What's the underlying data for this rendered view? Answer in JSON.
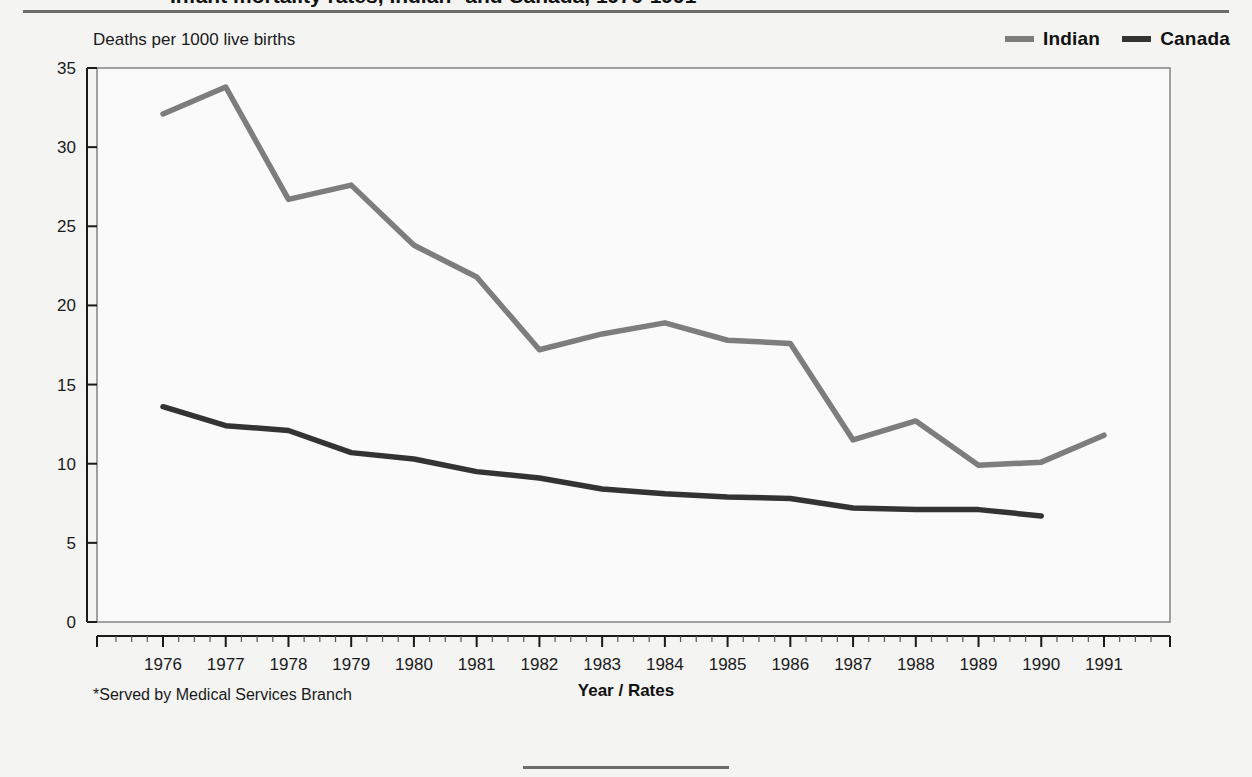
{
  "page": {
    "title_fragment": "Infant mortality rates, Indian* and Canada, 1976-1991",
    "background_color": "#f4f4f3",
    "rule_color": "#6d6d6d"
  },
  "legend": {
    "items": [
      {
        "label": "Indian",
        "color": "#7d7d7d"
      },
      {
        "label": "Canada",
        "color": "#333333"
      }
    ]
  },
  "labels": {
    "y_axis_caption": "Deaths per 1000 live births",
    "x_axis_title": "Year / Rates",
    "footnote": "*Served by Medical Services Branch"
  },
  "chart_data": {
    "type": "line",
    "title": "",
    "xlabel": "Year / Rates",
    "ylabel": "Deaths per 1000 live births",
    "x": [
      1976,
      1977,
      1978,
      1979,
      1980,
      1981,
      1982,
      1983,
      1984,
      1985,
      1986,
      1987,
      1988,
      1989,
      1990,
      1991
    ],
    "categories": [
      "1976",
      "1977",
      "1978",
      "1979",
      "1980",
      "1981",
      "1982",
      "1983",
      "1984",
      "1985",
      "1986",
      "1987",
      "1988",
      "1989",
      "1990",
      "1991"
    ],
    "xlim": [
      1976,
      1991
    ],
    "ylim": [
      0,
      35
    ],
    "yticks": [
      0,
      5,
      10,
      15,
      20,
      25,
      30,
      35
    ],
    "ytick_labels": [
      "0",
      "5",
      "10",
      "15",
      "20",
      "25",
      "30",
      "35"
    ],
    "grid": "vertical",
    "legend_position": "top-right",
    "series": [
      {
        "name": "Indian",
        "color": "#7d7d7d",
        "values": [
          32.1,
          33.8,
          26.7,
          27.6,
          23.8,
          21.8,
          17.2,
          18.2,
          18.9,
          17.8,
          17.6,
          11.5,
          12.7,
          9.9,
          10.1,
          11.8
        ]
      },
      {
        "name": "Canada",
        "color": "#333333",
        "values": [
          13.6,
          12.4,
          12.1,
          10.7,
          10.3,
          9.5,
          9.1,
          8.4,
          8.1,
          7.9,
          7.8,
          7.2,
          7.1,
          7.1,
          6.7,
          null
        ]
      }
    ]
  }
}
